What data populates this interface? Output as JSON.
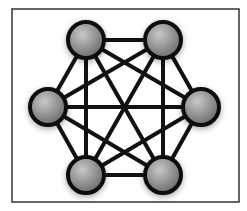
{
  "diagram": {
    "type": "complete-graph",
    "frame": {
      "x": 12,
      "y": 9,
      "width": 227,
      "height": 193,
      "stroke": "#333333"
    },
    "colors": {
      "edge": "#111111",
      "node_stroke": "#111111",
      "node_fill_light": "#c8c8c8",
      "node_fill_dark": "#6e6e6e",
      "background": "#ffffff"
    },
    "node_radius": 18,
    "nodes": [
      {
        "id": "n1",
        "cx": 86,
        "cy": 40
      },
      {
        "id": "n2",
        "cx": 163,
        "cy": 40
      },
      {
        "id": "n3",
        "cx": 201,
        "cy": 107
      },
      {
        "id": "n4",
        "cx": 163,
        "cy": 175
      },
      {
        "id": "n5",
        "cx": 86,
        "cy": 175
      },
      {
        "id": "n6",
        "cx": 48,
        "cy": 107
      }
    ],
    "edges": [
      [
        "n1",
        "n2"
      ],
      [
        "n1",
        "n3"
      ],
      [
        "n1",
        "n4"
      ],
      [
        "n1",
        "n5"
      ],
      [
        "n1",
        "n6"
      ],
      [
        "n2",
        "n3"
      ],
      [
        "n2",
        "n4"
      ],
      [
        "n2",
        "n5"
      ],
      [
        "n2",
        "n6"
      ],
      [
        "n3",
        "n4"
      ],
      [
        "n3",
        "n5"
      ],
      [
        "n3",
        "n6"
      ],
      [
        "n4",
        "n5"
      ],
      [
        "n4",
        "n6"
      ],
      [
        "n5",
        "n6"
      ]
    ]
  }
}
